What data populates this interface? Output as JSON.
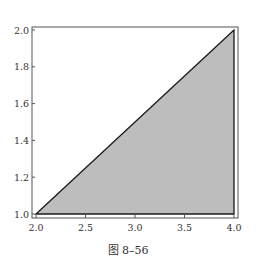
{
  "chart_data": {
    "type": "area",
    "title": "",
    "caption": "图 8–56",
    "xlabel": "",
    "ylabel": "",
    "xlim": [
      2.0,
      4.0
    ],
    "ylim": [
      1.0,
      2.0
    ],
    "grid": false,
    "legend": null,
    "x_ticks": [
      "2.0",
      "2.5",
      "3.0",
      "3.5",
      "4.0"
    ],
    "y_ticks": [
      "1.0",
      "1.2",
      "1.4",
      "1.6",
      "1.8",
      "2.0"
    ],
    "region": {
      "description": "Shaded triangle bounded by y = x/2, y = 1 and x = 4",
      "vertices": [
        [
          2.0,
          1.0
        ],
        [
          4.0,
          2.0
        ],
        [
          4.0,
          1.0
        ]
      ],
      "fill": "#bdbdbd",
      "edge": "#1a1a1a"
    }
  },
  "colors": {
    "frame": "#555555",
    "fill": "#bdbdbd",
    "edge": "#1a1a1a"
  }
}
